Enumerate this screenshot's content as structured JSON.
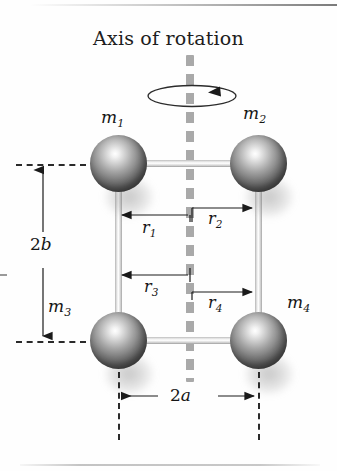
{
  "figure": {
    "title": "Axis of rotation",
    "background_color": "#fefefe",
    "ink_color": "#161616",
    "axis_color": "#a9a9a9",
    "sphere_color": "#5e5e5e"
  },
  "masses": [
    {
      "id": "m1",
      "label": "m",
      "subscript": "1",
      "position": "top-left"
    },
    {
      "id": "m2",
      "label": "m",
      "subscript": "2",
      "position": "top-right"
    },
    {
      "id": "m3",
      "label": "m",
      "subscript": "3",
      "position": "bottom-left"
    },
    {
      "id": "m4",
      "label": "m",
      "subscript": "4",
      "position": "bottom-right"
    }
  ],
  "radii": [
    {
      "id": "r1",
      "label": "r",
      "subscript": "1",
      "direction": "left",
      "from": "axis",
      "to": "m1-rod"
    },
    {
      "id": "r2",
      "label": "r",
      "subscript": "2",
      "direction": "right",
      "from": "axis",
      "to": "m2-rod"
    },
    {
      "id": "r3",
      "label": "r",
      "subscript": "3",
      "direction": "left",
      "from": "axis",
      "to": "m3-rod"
    },
    {
      "id": "r4",
      "label": "r",
      "subscript": "4",
      "direction": "right",
      "from": "axis",
      "to": "m4-rod"
    }
  ],
  "dimensions": [
    {
      "id": "2b",
      "prefix": "2",
      "symbol": "b",
      "orientation": "vertical",
      "meaning": "vertical separation between top and bottom masses"
    },
    {
      "id": "2a",
      "prefix": "2",
      "symbol": "a",
      "orientation": "horizontal",
      "meaning": "horizontal separation between left and right masses"
    }
  ],
  "annotations": {
    "rotation_arrow": "counterclockwise-spin-arrow",
    "axis_style": "dashed vertical line"
  }
}
